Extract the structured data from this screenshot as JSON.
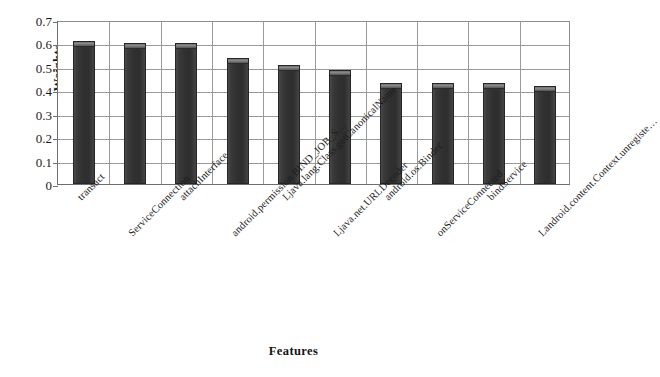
{
  "chart_data": {
    "type": "bar",
    "title": "",
    "xlabel": "Features",
    "ylabel": "Weights",
    "ylim": [
      0,
      0.7
    ],
    "yticks": [
      "0",
      "0.1",
      "0.2",
      "0.3",
      "0.4",
      "0.5",
      "0.6",
      "0.7"
    ],
    "ytick_values": [
      0,
      0.1,
      0.2,
      0.3,
      0.4,
      0.5,
      0.6,
      0.7
    ],
    "grid": true,
    "legend": false,
    "bar_color": "#3a3a3a",
    "categories": [
      "transact",
      "ServiceConnection",
      "attachInterface",
      "android.permission.BIND_JOB_S…",
      "Ljava.lang.Class.getCanonicalName",
      "Ljava.net.URLDecoder",
      "android.os.Binder",
      "onServiceConnected",
      "bindService",
      "Landroid.content.Context.unregiste…"
    ],
    "values": [
      0.61,
      0.6,
      0.6,
      0.54,
      0.51,
      0.485,
      0.43,
      0.43,
      0.43,
      0.42
    ],
    "bars": [
      {
        "label": "transact",
        "value": 0.61
      },
      {
        "label": "ServiceConnection",
        "value": 0.6
      },
      {
        "label": "attachInterface",
        "value": 0.6
      },
      {
        "label": "android.permission.BIND_JOB_S…",
        "value": 0.54
      },
      {
        "label": "Ljava.lang.Class.getCanonicalName",
        "value": 0.51
      },
      {
        "label": "Ljava.net.URLDecoder",
        "value": 0.485
      },
      {
        "label": "android.os.Binder",
        "value": 0.43
      },
      {
        "label": "onServiceConnected",
        "value": 0.43
      },
      {
        "label": "bindService",
        "value": 0.43
      },
      {
        "label": "Landroid.content.Context.unregiste…",
        "value": 0.42
      }
    ]
  }
}
